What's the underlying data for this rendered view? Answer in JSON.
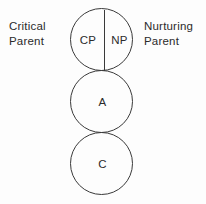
{
  "diagram": {
    "background_color": "#fdfdfd",
    "stroke_color": "#3a3a3a",
    "text_color": "#2b2b2b",
    "side_labels": {
      "left": "Critical\nParent",
      "right": "Nurturing\nParent"
    },
    "circles": [
      {
        "id": "parent",
        "split": true,
        "segments": [
          {
            "id": "cp",
            "label": "CP"
          },
          {
            "id": "np",
            "label": "NP"
          }
        ]
      },
      {
        "id": "adult",
        "split": false,
        "label": "A"
      },
      {
        "id": "child",
        "split": false,
        "label": "C"
      }
    ]
  }
}
